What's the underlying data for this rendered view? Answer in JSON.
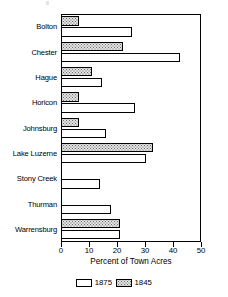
{
  "chart_data": {
    "type": "bar",
    "orientation": "horizontal",
    "title": "",
    "xlabel": "Percent of Town Acres",
    "ylabel": "",
    "xlim": [
      0,
      50
    ],
    "xticks": [
      0,
      10,
      20,
      30,
      40,
      50
    ],
    "xticklabels": [
      "0",
      "10",
      "20",
      "30",
      "40",
      "50"
    ],
    "grid": false,
    "legend_position": "bottom",
    "categories": [
      "Bolton",
      "Chester",
      "Hague",
      "Horicon",
      "Johnsburg",
      "Lake Luzerne",
      "Stony Creek",
      "Thurman",
      "Warrensburg"
    ],
    "series": [
      {
        "name": "1875",
        "fill": "white",
        "values": [
          25.5,
          42.5,
          14.5,
          26.5,
          16.0,
          30.5,
          14.0,
          18.0,
          21.0
        ]
      },
      {
        "name": "1845",
        "fill": "stippled",
        "values": [
          6.5,
          22.0,
          11.0,
          6.5,
          6.5,
          33.0,
          0,
          0,
          21.0
        ]
      }
    ]
  },
  "legend": {
    "entries": [
      {
        "label": "1875",
        "swatch": "white-box"
      },
      {
        "label": "1845",
        "swatch": "stippled-box"
      }
    ]
  },
  "colors": {
    "axis": "#000000",
    "bar_outline": "#000000",
    "series_1875_fill": "#ffffff",
    "series_1845_fill": "#e2e2e2",
    "stipple_dot": "#6f6f6f",
    "background": "#ffffff"
  }
}
